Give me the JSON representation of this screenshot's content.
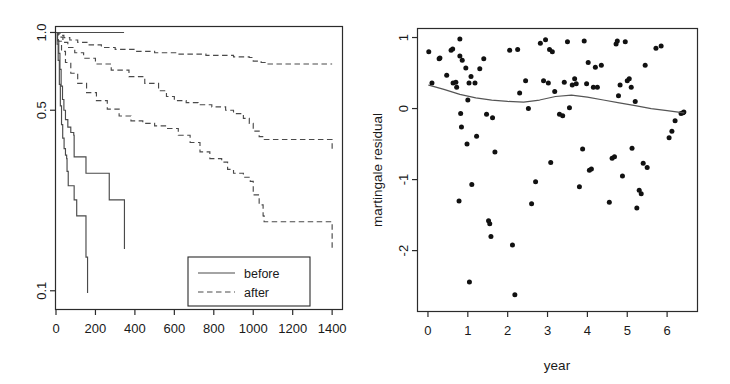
{
  "figure": {
    "title": "",
    "width": 730,
    "height": 384,
    "background": "#ffffff",
    "ink_color": "#2b2b2b"
  },
  "chart_data": [
    {
      "id": "survival-curves",
      "type": "line",
      "title": "",
      "xlabel": "",
      "ylabel": "",
      "xlim": [
        0,
        1450
      ],
      "ylim_log": [
        0.085,
        1.05
      ],
      "y_scale": "log",
      "grid": false,
      "xticks": [
        0,
        200,
        400,
        600,
        800,
        1000,
        1200,
        1400
      ],
      "xtick_labels": [
        "0",
        "200",
        "400",
        "600",
        "800",
        "1000",
        "1200",
        "1400"
      ],
      "yticks": [
        1.0,
        0.5,
        0.1
      ],
      "ytick_labels": [
        "1.0",
        "0.5",
        "0.1"
      ],
      "legend": {
        "position": "bottom-right",
        "entries": [
          {
            "label": "before",
            "style": "solid"
          },
          {
            "label": "after",
            "style": "dashed"
          }
        ]
      },
      "series": [
        {
          "name": "before-top",
          "style": "solid",
          "points": [
            [
              0,
              1.0
            ],
            [
              30,
              1.0
            ],
            [
              345,
              1.0
            ]
          ]
        },
        {
          "name": "before-q2",
          "style": "solid",
          "points": [
            [
              0,
              1.0
            ],
            [
              8,
              0.93
            ],
            [
              14,
              0.83
            ],
            [
              20,
              0.72
            ],
            [
              26,
              0.62
            ],
            [
              33,
              0.55
            ],
            [
              40,
              0.5
            ],
            [
              48,
              0.46
            ],
            [
              60,
              0.43
            ],
            [
              75,
              0.41
            ],
            [
              90,
              0.4
            ],
            [
              92,
              0.33
            ],
            [
              150,
              0.33
            ],
            [
              152,
              0.285
            ],
            [
              268,
              0.285
            ],
            [
              270,
              0.225
            ],
            [
              345,
              0.225
            ],
            [
              347,
              0.145
            ]
          ]
        },
        {
          "name": "before-q3",
          "style": "solid",
          "points": [
            [
              0,
              1.0
            ],
            [
              6,
              0.9
            ],
            [
              11,
              0.78
            ],
            [
              17,
              0.63
            ],
            [
              22,
              0.52
            ],
            [
              28,
              0.44
            ],
            [
              34,
              0.39
            ],
            [
              41,
              0.355
            ],
            [
              48,
              0.335
            ],
            [
              54,
              0.325
            ],
            [
              56,
              0.29
            ],
            [
              60,
              0.29
            ],
            [
              62,
              0.255
            ],
            [
              90,
              0.255
            ],
            [
              92,
              0.225
            ],
            [
              103,
              0.225
            ],
            [
              105,
              0.195
            ],
            [
              150,
              0.195
            ],
            [
              152,
              0.135
            ],
            [
              158,
              0.135
            ],
            [
              160,
              0.098
            ]
          ]
        },
        {
          "name": "after-q1",
          "style": "dashed",
          "points": [
            [
              0,
              1.0
            ],
            [
              20,
              0.975
            ],
            [
              40,
              0.955
            ],
            [
              70,
              0.935
            ],
            [
              110,
              0.915
            ],
            [
              160,
              0.895
            ],
            [
              230,
              0.875
            ],
            [
              300,
              0.86
            ],
            [
              400,
              0.845
            ],
            [
              500,
              0.835
            ],
            [
              620,
              0.825
            ],
            [
              760,
              0.815
            ],
            [
              900,
              0.805
            ],
            [
              980,
              0.8
            ],
            [
              1000,
              0.775
            ],
            [
              1040,
              0.765
            ],
            [
              1060,
              0.755
            ],
            [
              1400,
              0.755
            ]
          ]
        },
        {
          "name": "after-q2",
          "style": "dashed",
          "points": [
            [
              0,
              1.0
            ],
            [
              15,
              0.96
            ],
            [
              35,
              0.915
            ],
            [
              60,
              0.875
            ],
            [
              95,
              0.835
            ],
            [
              140,
              0.795
            ],
            [
              200,
              0.755
            ],
            [
              280,
              0.715
            ],
            [
              370,
              0.675
            ],
            [
              450,
              0.635
            ],
            [
              520,
              0.595
            ],
            [
              560,
              0.565
            ],
            [
              600,
              0.545
            ],
            [
              660,
              0.535
            ],
            [
              720,
              0.525
            ],
            [
              790,
              0.515
            ],
            [
              860,
              0.5
            ],
            [
              900,
              0.485
            ],
            [
              950,
              0.465
            ],
            [
              980,
              0.445
            ],
            [
              1000,
              0.415
            ],
            [
              1030,
              0.395
            ],
            [
              1055,
              0.385
            ],
            [
              1380,
              0.385
            ],
            [
              1400,
              0.345
            ]
          ]
        },
        {
          "name": "after-q3",
          "style": "dashed",
          "points": [
            [
              0,
              1.0
            ],
            [
              12,
              0.925
            ],
            [
              28,
              0.845
            ],
            [
              48,
              0.765
            ],
            [
              75,
              0.695
            ],
            [
              110,
              0.635
            ],
            [
              155,
              0.585
            ],
            [
              205,
              0.545
            ],
            [
              260,
              0.505
            ],
            [
              320,
              0.475
            ],
            [
              380,
              0.455
            ],
            [
              440,
              0.445
            ],
            [
              500,
              0.435
            ],
            [
              560,
              0.425
            ],
            [
              620,
              0.4
            ],
            [
              680,
              0.375
            ],
            [
              730,
              0.345
            ],
            [
              780,
              0.325
            ],
            [
              840,
              0.315
            ],
            [
              870,
              0.295
            ],
            [
              900,
              0.285
            ],
            [
              950,
              0.275
            ],
            [
              985,
              0.265
            ],
            [
              1000,
              0.235
            ],
            [
              1030,
              0.215
            ],
            [
              1050,
              0.195
            ],
            [
              1055,
              0.185
            ],
            [
              1380,
              0.185
            ],
            [
              1400,
              0.145
            ]
          ]
        }
      ]
    },
    {
      "id": "martingale-residuals",
      "type": "scatter",
      "title": "",
      "xlabel": "year",
      "ylabel": "martingale residual",
      "xlim": [
        -0.25,
        6.75
      ],
      "ylim": [
        -2.85,
        1.12
      ],
      "grid": false,
      "xticks": [
        0,
        1,
        2,
        3,
        4,
        5,
        6
      ],
      "xtick_labels": [
        "0",
        "1",
        "2",
        "3",
        "4",
        "5",
        "6"
      ],
      "yticks": [
        1,
        0,
        -1,
        -2
      ],
      "ytick_labels": [
        "1",
        "0",
        "-1",
        "-2"
      ],
      "points": [
        [
          0.02,
          0.8
        ],
        [
          0.1,
          0.36
        ],
        [
          0.28,
          0.7
        ],
        [
          0.3,
          0.71
        ],
        [
          0.47,
          0.47
        ],
        [
          0.58,
          0.82
        ],
        [
          0.62,
          0.84
        ],
        [
          0.63,
          0.36
        ],
        [
          0.7,
          0.37
        ],
        [
          0.72,
          0.3
        ],
        [
          0.78,
          -1.3
        ],
        [
          0.8,
          0.98
        ],
        [
          0.8,
          0.74
        ],
        [
          0.82,
          -0.07
        ],
        [
          0.84,
          -0.26
        ],
        [
          0.86,
          0.68
        ],
        [
          0.95,
          0.57
        ],
        [
          0.98,
          -0.5
        ],
        [
          1.0,
          0.12
        ],
        [
          1.03,
          0.36
        ],
        [
          1.04,
          -2.44
        ],
        [
          1.08,
          0.45
        ],
        [
          1.1,
          -1.07
        ],
        [
          1.18,
          0.36
        ],
        [
          1.22,
          -0.39
        ],
        [
          1.3,
          0.56
        ],
        [
          1.4,
          0.7
        ],
        [
          1.47,
          -0.08
        ],
        [
          1.52,
          -1.58
        ],
        [
          1.55,
          -1.62
        ],
        [
          1.58,
          -1.8
        ],
        [
          1.62,
          -0.13
        ],
        [
          1.68,
          -0.61
        ],
        [
          2.05,
          0.82
        ],
        [
          2.12,
          -1.92
        ],
        [
          2.18,
          -2.62
        ],
        [
          2.25,
          0.83
        ],
        [
          2.3,
          0.22
        ],
        [
          2.45,
          0.39
        ],
        [
          2.52,
          0.0
        ],
        [
          2.6,
          -1.34
        ],
        [
          2.7,
          -1.03
        ],
        [
          2.82,
          0.92
        ],
        [
          2.9,
          0.39
        ],
        [
          2.95,
          0.97
        ],
        [
          3.02,
          0.36
        ],
        [
          3.05,
          0.83
        ],
        [
          3.08,
          -0.76
        ],
        [
          3.12,
          0.8
        ],
        [
          3.18,
          0.24
        ],
        [
          3.3,
          -0.08
        ],
        [
          3.38,
          -0.1
        ],
        [
          3.42,
          0.37
        ],
        [
          3.5,
          0.94
        ],
        [
          3.55,
          0.01
        ],
        [
          3.62,
          0.33
        ],
        [
          3.68,
          0.42
        ],
        [
          3.72,
          0.35
        ],
        [
          3.8,
          -1.1
        ],
        [
          3.88,
          -0.57
        ],
        [
          3.92,
          0.95
        ],
        [
          3.98,
          0.35
        ],
        [
          4.02,
          0.65
        ],
        [
          4.05,
          -0.87
        ],
        [
          4.1,
          -0.85
        ],
        [
          4.15,
          0.3
        ],
        [
          4.2,
          0.58
        ],
        [
          4.25,
          0.3
        ],
        [
          4.35,
          0.61
        ],
        [
          4.55,
          -1.32
        ],
        [
          4.62,
          -0.7
        ],
        [
          4.68,
          -0.68
        ],
        [
          4.72,
          0.91
        ],
        [
          4.75,
          0.95
        ],
        [
          4.78,
          0.18
        ],
        [
          4.82,
          0.33
        ],
        [
          4.88,
          -0.95
        ],
        [
          4.95,
          0.94
        ],
        [
          5.0,
          0.39
        ],
        [
          5.05,
          0.42
        ],
        [
          5.1,
          0.3
        ],
        [
          5.12,
          -0.56
        ],
        [
          5.2,
          0.1
        ],
        [
          5.24,
          -1.4
        ],
        [
          5.3,
          -1.15
        ],
        [
          5.35,
          -1.2
        ],
        [
          5.4,
          -0.77
        ],
        [
          5.45,
          0.61
        ],
        [
          5.5,
          -0.83
        ],
        [
          5.72,
          0.85
        ],
        [
          5.85,
          0.88
        ],
        [
          6.05,
          -0.41
        ],
        [
          6.12,
          -0.32
        ],
        [
          6.2,
          -0.17
        ],
        [
          6.35,
          -0.07
        ],
        [
          6.4,
          -0.06
        ],
        [
          6.42,
          -0.05
        ]
      ],
      "smooth": {
        "name": "loess",
        "points": [
          [
            0.02,
            0.33
          ],
          [
            0.4,
            0.27
          ],
          [
            0.8,
            0.2
          ],
          [
            1.2,
            0.15
          ],
          [
            1.6,
            0.12
          ],
          [
            2.0,
            0.1
          ],
          [
            2.4,
            0.09
          ],
          [
            2.8,
            0.12
          ],
          [
            3.2,
            0.17
          ],
          [
            3.6,
            0.19
          ],
          [
            4.0,
            0.16
          ],
          [
            4.4,
            0.12
          ],
          [
            4.8,
            0.08
          ],
          [
            5.2,
            0.04
          ],
          [
            5.6,
            0.0
          ],
          [
            6.0,
            -0.03
          ],
          [
            6.42,
            -0.06
          ]
        ]
      }
    }
  ]
}
